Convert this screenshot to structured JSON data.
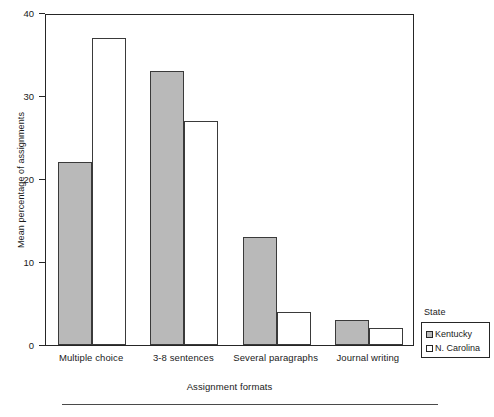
{
  "chart_data": {
    "type": "bar",
    "title": "",
    "xlabel": "Assignment formats",
    "ylabel": "Mean percentage of assignments",
    "categories": [
      "Multiple choice",
      "3-8 sentences",
      "Several paragraphs",
      "Journal writing"
    ],
    "series": [
      {
        "name": "Kentucky",
        "values": [
          22,
          33,
          13,
          3
        ],
        "fill": "#b9b9b9",
        "edge": "#3a3a3a"
      },
      {
        "name": "N. Carolina",
        "values": [
          37,
          27,
          4,
          2
        ],
        "fill": "#ffffff",
        "edge": "#3a3a3a"
      }
    ],
    "ylim": [
      0,
      40
    ],
    "yticks": [
      0,
      10,
      20,
      30,
      40
    ],
    "ytick_labels": [
      "0",
      "10",
      "20",
      "30",
      "40"
    ],
    "grid": false,
    "legend": {
      "title": "State",
      "position": "right",
      "entries": [
        {
          "label": "Kentucky",
          "swatch": "filled-gray"
        },
        {
          "label": "N. Carolina",
          "swatch": "open-white"
        }
      ]
    }
  }
}
